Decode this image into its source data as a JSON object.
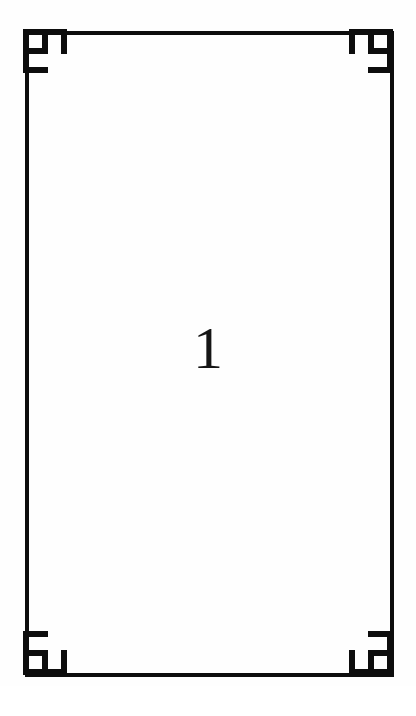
{
  "document": {
    "page_number": "1",
    "background_color": "#ffffff",
    "paper_color": "#fefefe",
    "ink_color": "#0d0d0d"
  },
  "frame": {
    "name": "page-border-frame",
    "stroke_color": "#0d0d0d",
    "stroke_width_px": 4,
    "left_px": 25,
    "top_px": 31,
    "width_px": 369,
    "height_px": 646
  },
  "ornaments": {
    "description": "decorative stepped corner blocks",
    "count": 4,
    "size_px": 44,
    "color": "#0d0d0d",
    "corners": [
      {
        "id": "top-left",
        "label": "top-left-corner-ornament"
      },
      {
        "id": "top-right",
        "label": "top-right-corner-ornament"
      },
      {
        "id": "bottom-left",
        "label": "bottom-left-corner-ornament"
      },
      {
        "id": "bottom-right",
        "label": "bottom-right-corner-ornament"
      }
    ]
  },
  "content": {
    "center_text": "1",
    "center_text_color": "#151515",
    "center_font_size_px": 60
  }
}
